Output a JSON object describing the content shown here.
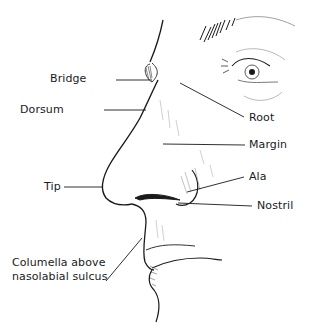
{
  "figure": {
    "labels": {
      "bridge": "Bridge",
      "dorsum": "Dorsum",
      "root": "Root",
      "margin": "Margin",
      "ala": "Ala",
      "tip": "Tip",
      "nostril": "Nostril",
      "columella_line1": "Columella above",
      "columella_line2": "nasolabial sulcus"
    },
    "colors": {
      "ink": "#1a1a1a",
      "shading": "#8a8a8a",
      "background": "#ffffff"
    }
  }
}
